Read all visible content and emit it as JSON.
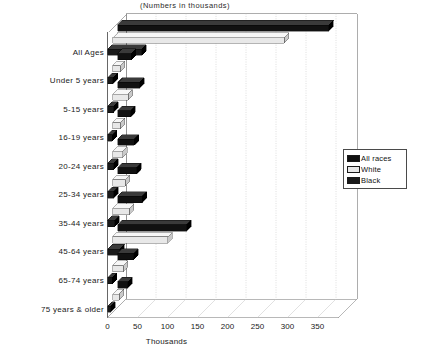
{
  "chart_data": {
    "type": "bar",
    "orientation": "horizontal",
    "style": "3d-grouped-bar",
    "title": "(Numbers in thousands)",
    "xlabel": "Thousands",
    "ylabel": "",
    "xlim": [
      0,
      385
    ],
    "xticks": [
      "0",
      "50",
      "100",
      "150",
      "200",
      "250",
      "300",
      "350"
    ],
    "xtick_values": [
      0,
      50,
      100,
      150,
      200,
      250,
      300,
      350
    ],
    "grid": true,
    "grid_axis": "x",
    "legend_position": "right",
    "categories": [
      "All  Ages",
      "Under  5  years",
      "5-15  years",
      "16-19  years",
      "20-24  years",
      "25-34  years",
      "35-44  years",
      "45-64  years",
      "65-74  years",
      "75  years  &  older"
    ],
    "series": [
      {
        "name": "All  races",
        "color": "#111111",
        "values": [
          352,
          23,
          37,
          22,
          28,
          32,
          41,
          115,
          27,
          17
        ]
      },
      {
        "name": "White",
        "color": "#e8e8e8",
        "values": [
          286,
          13,
          26,
          13,
          17,
          21,
          28,
          92,
          18,
          11
        ]
      },
      {
        "name": "Black",
        "color": "#1a1a1a",
        "values": [
          57,
          9,
          10,
          8,
          10,
          10,
          12,
          20,
          8,
          5
        ]
      }
    ]
  },
  "legend": {
    "items": [
      {
        "label": "All  races",
        "swatch": "#111111"
      },
      {
        "label": "White",
        "swatch": "#e8e8e8"
      },
      {
        "label": "Black",
        "swatch": "#1a1a1a"
      }
    ]
  },
  "axis": {
    "x_title": "Thousands",
    "tick_labels": [
      "0",
      "50",
      "100",
      "150",
      "200",
      "250",
      "300",
      "350"
    ]
  },
  "title": "(Numbers in thousands)"
}
